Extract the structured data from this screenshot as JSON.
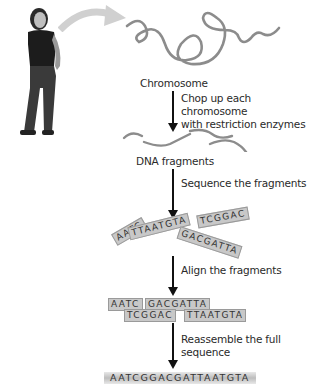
{
  "figure": {
    "person_alt": "Person standing",
    "stages": [
      {
        "label": "Chromosome"
      },
      {
        "label": "DNA fragments"
      }
    ],
    "steps": [
      {
        "line1": "Chop up each chromosome",
        "line2": "with restriction enzymes"
      },
      {
        "line1": "Sequence the fragments"
      },
      {
        "line1": "Align the fragments"
      },
      {
        "line1": "Reassemble the full",
        "line2": "sequence"
      }
    ],
    "sequenced_fragments": [
      "AATC",
      "TTAATGTA",
      "TCGGAC",
      "GACGATTA"
    ],
    "aligned_row1": [
      "AATC",
      "GACGATTA"
    ],
    "aligned_row2": [
      "TCGGAC",
      "TTAATGTA"
    ],
    "full_sequence": "AATCGGACGATTAATGTA",
    "colors": {
      "fragment_fill": "#c8c8c8",
      "strand": "#8c8c8c",
      "arrow": "#111111"
    }
  }
}
